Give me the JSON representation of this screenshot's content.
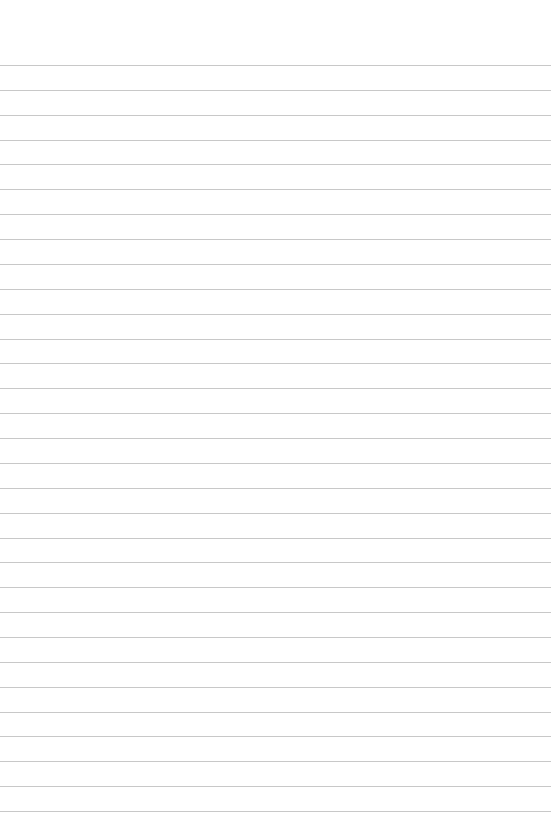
{
  "page": {
    "type": "lined-paper",
    "background_color": "#ffffff",
    "line_color": "#c8c8c8",
    "line_count": 31,
    "first_line_y": 65,
    "line_spacing": 24.87
  }
}
